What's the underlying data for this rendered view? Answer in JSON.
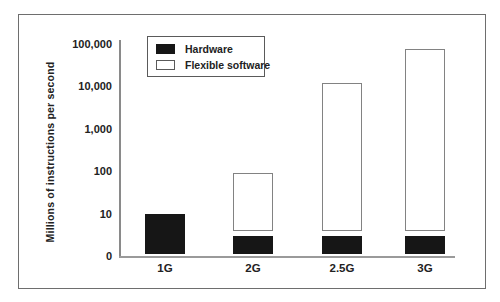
{
  "chart_data": {
    "type": "bar",
    "stacked": true,
    "log_scale_y": true,
    "title": "",
    "xlabel": "",
    "ylabel": "Millions of instructions per second",
    "categories": [
      "1G",
      "2G",
      "2.5G",
      "3G"
    ],
    "series": [
      {
        "name": "Hardware",
        "color": "#161616",
        "values": [
          10,
          3,
          3,
          3
        ]
      },
      {
        "name": "Flexible software",
        "color": "#ffffff",
        "values": [
          null,
          90,
          12000,
          75000
        ]
      }
    ],
    "yticks": [
      {
        "label": "100,000",
        "value": 100000
      },
      {
        "label": "10,000",
        "value": 10000
      },
      {
        "label": "1,000",
        "value": 1000
      },
      {
        "label": "100",
        "value": 100
      },
      {
        "label": "10",
        "value": 10
      },
      {
        "label": "0",
        "value": 1
      }
    ],
    "ylim_log": [
      1,
      200000
    ],
    "grid": false,
    "legend_position": "top-left-inside"
  }
}
